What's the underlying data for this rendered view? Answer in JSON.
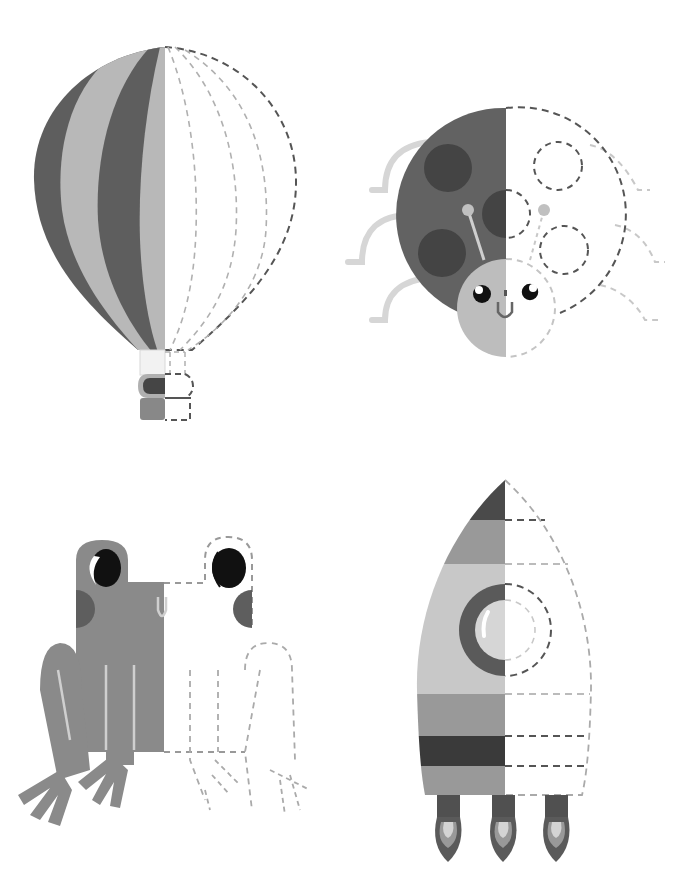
{
  "worksheet": {
    "header_text": "",
    "instruction": "Trace the dashed half of each picture",
    "palette": {
      "dark": "#5c5c5c",
      "darker": "#484848",
      "mid": "#8c8c8c",
      "light": "#b6b6b6",
      "pale": "#cfcfcf",
      "black": "#111111",
      "dash_dark": "#555555",
      "dash_light": "#b0b0b0"
    },
    "figures": [
      {
        "id": "hot-air-balloon",
        "label": "Hot air balloon"
      },
      {
        "id": "ladybug",
        "label": "Ladybug"
      },
      {
        "id": "frog",
        "label": "Frog"
      },
      {
        "id": "rocket",
        "label": "Rocket"
      }
    ]
  }
}
